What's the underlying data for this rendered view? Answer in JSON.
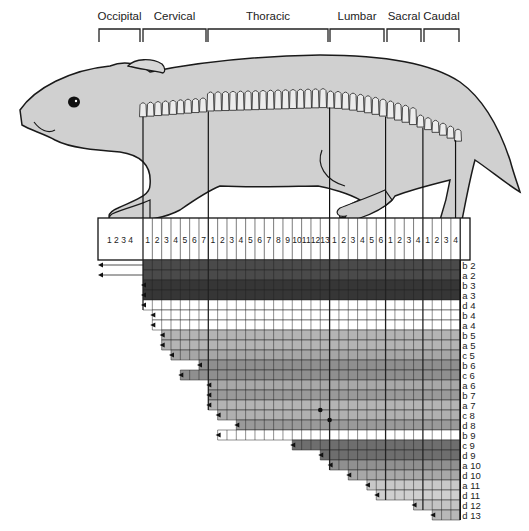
{
  "regions": [
    {
      "label": "Occipital",
      "x1": 99,
      "x2": 140
    },
    {
      "label": "Cervical",
      "x1": 143,
      "x2": 206
    },
    {
      "label": "Thoracic",
      "x1": 208,
      "x2": 328
    },
    {
      "label": "Lumbar",
      "x1": 330,
      "x2": 384
    },
    {
      "label": "Sacral",
      "x1": 387,
      "x2": 421
    },
    {
      "label": "Caudal",
      "x1": 424,
      "x2": 459
    }
  ],
  "occipital_numbers": "1 2 3 4",
  "column_groups": [
    {
      "name": "Cervical",
      "count": 7
    },
    {
      "name": "Thoracic",
      "count": 13
    },
    {
      "name": "Lumbar",
      "count": 6
    },
    {
      "name": "Sacral",
      "count": 4
    },
    {
      "name": "Caudal",
      "count": 4
    }
  ],
  "rows": [
    {
      "label": "b 2",
      "start": -1,
      "shade": "#4a4a4a"
    },
    {
      "label": "a 2",
      "start": -1,
      "shade": "#4a4a4a"
    },
    {
      "label": "b 3",
      "start": 0,
      "shade": "#363636"
    },
    {
      "label": "a 3",
      "start": 0,
      "shade": "#363636"
    },
    {
      "label": "d 4",
      "start": 0,
      "shade": "#ffffff"
    },
    {
      "label": "b 4",
      "start": 1,
      "shade": "#ffffff"
    },
    {
      "label": "a 4",
      "start": 1,
      "shade": "#ffffff"
    },
    {
      "label": "b 5",
      "start": 2,
      "shade": "#b4b4b4"
    },
    {
      "label": "a 5",
      "start": 2,
      "shade": "#b4b4b4"
    },
    {
      "label": "c 5",
      "start": 3,
      "shade": "#a6a6a6"
    },
    {
      "label": "b 6",
      "start": 6,
      "shade": "#8f8f8f"
    },
    {
      "label": "c 6",
      "start": 4,
      "shade": "#8f8f8f"
    },
    {
      "label": "a 6",
      "start": 7,
      "shade": "#a8a8a8"
    },
    {
      "label": "b 7",
      "start": 7,
      "shade": "#9a9a9a"
    },
    {
      "label": "a 7",
      "start": 7,
      "shade": "#b4b4b4"
    },
    {
      "label": "c 8",
      "start": 8,
      "shade": "#b0b0b0"
    },
    {
      "label": "d 8",
      "start": 10,
      "shade": "#9a9a9a"
    },
    {
      "label": "b 9",
      "start": 8,
      "shade": "#ffffff"
    },
    {
      "label": "c 9",
      "start": 16,
      "shade": "#6e6e6e"
    },
    {
      "label": "d 9",
      "start": 19,
      "shade": "#6e6e6e"
    },
    {
      "label": "a 10",
      "start": 20,
      "shade": "#909090"
    },
    {
      "label": "d 10",
      "start": 22,
      "shade": "#a8a8a8"
    },
    {
      "label": "a 11",
      "start": 24,
      "shade": "#c8c8c8"
    },
    {
      "label": "d 11",
      "start": 25,
      "shade": "#cfcfcf"
    },
    {
      "label": "d 12",
      "start": 29,
      "shade": "#c4c4c4"
    },
    {
      "label": "d 13",
      "start": 31,
      "shade": "#b8b8b8"
    }
  ],
  "dots": [
    {
      "row": 15,
      "col": 19
    },
    {
      "row": 16,
      "col": 20
    }
  ],
  "colors": {
    "body": "#d0d0d0",
    "outline": "#1a1a1a",
    "bone": "#ececec"
  }
}
